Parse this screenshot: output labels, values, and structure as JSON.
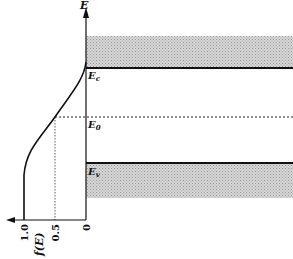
{
  "diagram": {
    "type": "energy-band-diagram-with-fermi-dirac-distribution",
    "vertical_axis_label": "E",
    "horizontal_axis_label": "f(E)",
    "horizontal_ticks": [
      "1.0",
      "0.5",
      "0"
    ],
    "levels": {
      "conduction_band_edge": "E",
      "conduction_band_edge_sub": "c",
      "fermi_level": "E",
      "fermi_level_sub": "0",
      "valence_band_edge": "E",
      "valence_band_edge_sub": "v"
    },
    "colors": {
      "line": "#111111",
      "band_fill": "#c8c8c8"
    }
  }
}
